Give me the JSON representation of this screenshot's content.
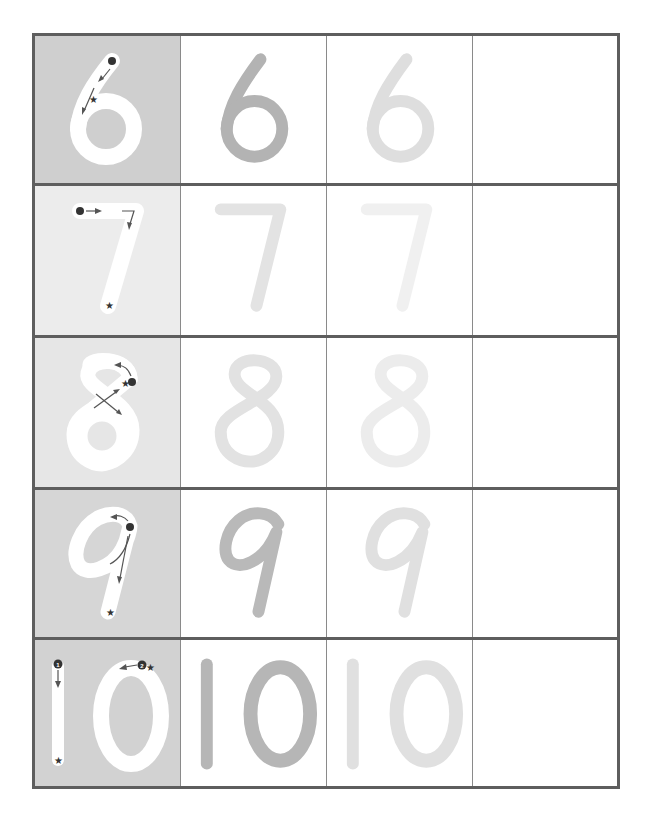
{
  "worksheet": {
    "title": "Number tracing worksheet 6-10",
    "colors": {
      "frame": "#5e5e5e",
      "divider": "#8a8a8a",
      "model_stroke": "#ffffff",
      "guide_marks": "#555555",
      "trace_dark": "#b3b3b3",
      "trace_light": "#dedede",
      "trace_lighter": "#ebebeb"
    },
    "rows": [
      {
        "digit": "6",
        "model_bg": "#cfcfcf",
        "trace1_color": "#b3b3b3",
        "trace2_color": "#dedede",
        "start_marker": "dot",
        "end_marker": "star",
        "blank": ""
      },
      {
        "digit": "7",
        "model_bg": "#ececec",
        "trace1_color": "#e3e3e3",
        "trace2_color": "#f0f0f0",
        "start_marker": "dot",
        "end_marker": "star",
        "blank": ""
      },
      {
        "digit": "8",
        "model_bg": "#e6e6e6",
        "trace1_color": "#e2e2e2",
        "trace2_color": "#ececec",
        "start_marker": "dot",
        "end_marker": "star",
        "blank": ""
      },
      {
        "digit": "9",
        "model_bg": "#d6d6d6",
        "trace1_color": "#b9b9b9",
        "trace2_color": "#e0e0e0",
        "start_marker": "dot",
        "end_marker": "star",
        "blank": ""
      },
      {
        "digit": "10",
        "model_bg": "#d2d2d2",
        "trace1_color": "#b6b6b6",
        "trace2_color": "#e0e0e0",
        "stroke_order": [
          "1",
          "2"
        ],
        "start_marker": "numbered-dot",
        "end_marker": "star",
        "blank": ""
      }
    ]
  }
}
